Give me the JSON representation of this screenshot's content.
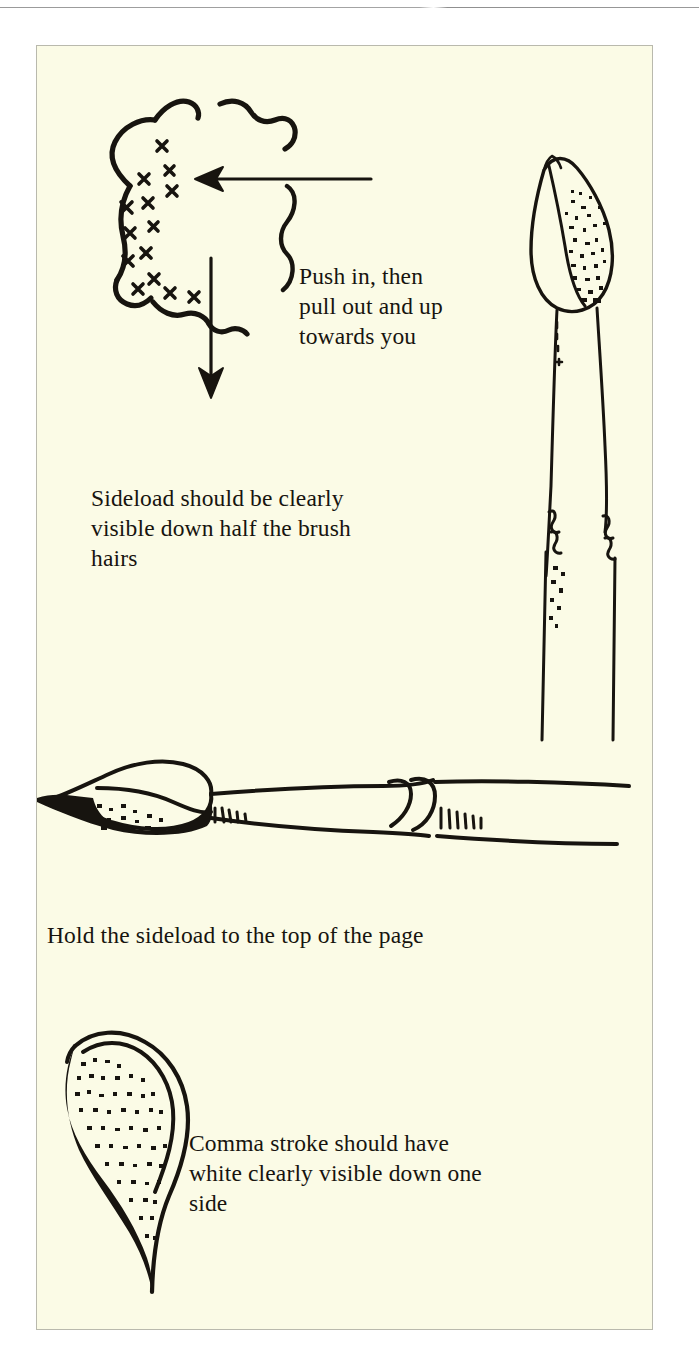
{
  "document": {
    "title": "Sideload Brush Loading Instructions",
    "page_background": "#ffffff",
    "plate_background": "#fbfbe6",
    "ink_color": "#17140f",
    "rule_color": "#9a9a9a"
  },
  "captions": {
    "push": "Push in, then\npull out and up\ntowards you",
    "sideload": "Sideload should be clearly\nvisible down half the brush\nhairs",
    "hold": "Hold the sideload to the top of the page",
    "comma": "Comma stroke should have\nwhite clearly visible down one\nside"
  },
  "figures": [
    {
      "name": "paint-puddle-diagram",
      "description": "Hand-drawn irregular circular paint puddle with X hatch marks along the inner left edge",
      "annotations": [
        "left-arrow",
        "down-arrow",
        "curly-brace"
      ]
    },
    {
      "name": "brush-vertical-loaded",
      "description": "Vertical flat brush shown tip-up, sideload shading visible down one half of the hairs"
    },
    {
      "name": "brush-horizontal-loaded",
      "description": "Horizontal brush lying on its side with the sideload held to the top of the page"
    },
    {
      "name": "comma-stroke",
      "description": "Comma stroke with white clearly visible down one side"
    }
  ],
  "arrows": {
    "left_arrow_label": "push-in-direction",
    "down_arrow_label": "pull-down-direction"
  }
}
